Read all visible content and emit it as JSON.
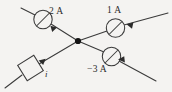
{
  "figure": {
    "kind": "circuit-junction-diagram",
    "background_color": "#f4f3f1",
    "line_color": "#3a3a3a",
    "text_color": "#2b2b2b"
  },
  "junction": {
    "label": "junction-node",
    "x": 78,
    "y": 41
  },
  "branches": [
    {
      "id": "upper-left",
      "label": "2 A",
      "current_value": 2,
      "unit": "A",
      "has_meter": true,
      "meter_type": "ammeter",
      "arrow_direction": "toward-junction",
      "line_from": [
        21,
        8
      ],
      "line_to": [
        78,
        41
      ]
    },
    {
      "id": "upper-right",
      "label": "1 A",
      "current_value": 1,
      "unit": "A",
      "has_meter": true,
      "meter_type": "ammeter",
      "arrow_direction": "toward-junction",
      "line_from": [
        168,
        13
      ],
      "line_to": [
        78,
        41
      ]
    },
    {
      "id": "lower-right",
      "label": "-3 A",
      "current_value": -3,
      "unit": "A",
      "has_meter": true,
      "meter_type": "ammeter",
      "arrow_direction": "toward-junction",
      "line_from": [
        156,
        81
      ],
      "line_to": [
        78,
        41
      ]
    },
    {
      "id": "lower-left",
      "label": "i",
      "current_value": "i",
      "unit": "",
      "has_meter": false,
      "element": "box",
      "arrow_direction": "toward-junction",
      "line_from": [
        5,
        88
      ],
      "line_to": [
        78,
        41
      ]
    }
  ],
  "labels": {
    "top_left": "2 A",
    "top_right": "1 A",
    "bottom_right": "−3 A",
    "bottom_left": "i"
  }
}
